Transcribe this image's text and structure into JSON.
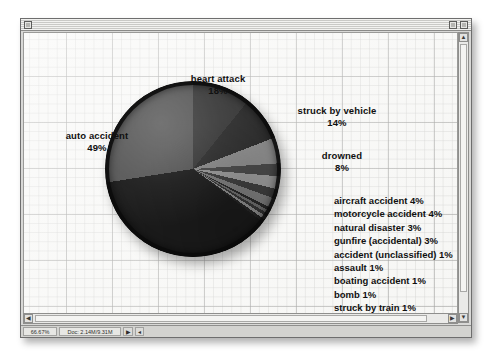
{
  "window": {
    "close_box": "close-box",
    "zoom_box": "zoom-box",
    "collapse_box": "collapse-box"
  },
  "statusbar": {
    "zoom_level": "66.67%",
    "doc_size": "Doc: 2.14M/9.31M",
    "popup_arrow": "▶",
    "caret": "◂"
  },
  "scrollbar": {
    "up_arrow": "▲",
    "down_arrow": "▼",
    "left_arrow": "◀",
    "right_arrow": "▶"
  },
  "labels": {
    "heart_attack": {
      "name": "heart attack",
      "pct": "18%"
    },
    "struck_by_vehicle": {
      "name": "struck by vehicle",
      "pct": "14%"
    },
    "drowned": {
      "name": "drowned",
      "pct": "8%"
    },
    "auto_accident": {
      "name": "auto accident",
      "pct": "49%"
    },
    "gunfire": {
      "name": "gunfire",
      "pct": "62%"
    }
  },
  "small_labels": [
    "aircraft accident 4%",
    "motorcycle accident 4%",
    "natural disaster 3%",
    "gunfire (accidental) 3%",
    "accident (unclassified) 1%",
    "assault 1%",
    "boating accident 1%",
    "bomb 1%",
    "struck by train 1%"
  ],
  "chart_data": {
    "type": "pie",
    "title": "",
    "legend_position": "callout-labels",
    "categories": [
      "gunfire",
      "auto accident",
      "heart attack",
      "struck by vehicle",
      "drowned",
      "aircraft accident",
      "motorcycle accident",
      "natural disaster",
      "gunfire (accidental)",
      "accident (unclassified)",
      "assault",
      "boating accident",
      "bomb",
      "struck by train"
    ],
    "values": [
      62,
      49,
      18,
      14,
      8,
      4,
      4,
      3,
      3,
      1,
      1,
      1,
      1,
      1
    ],
    "value_labels": [
      "62%",
      "49%",
      "18%",
      "14%",
      "8%",
      "4%",
      "4%",
      "3%",
      "3%",
      "1%",
      "1%",
      "1%",
      "1%",
      "1%"
    ],
    "colors": [
      "#1c1c1c",
      "#585858",
      "#3a3a3a",
      "#2e2e2e",
      "#8c8c8c",
      "#4a4a4a",
      "#9a9a9a",
      "#3f3f3f",
      "#7e7e7e",
      "#2b2b2b",
      "#6f6f6f",
      "#383838",
      "#8f8f8f",
      "#262626"
    ],
    "slice_gradient": "conic-gradient(from 0deg at 50% 50%, #3a3a3a 0deg 38.9deg, #2e2e2e 38.9deg 68.9deg, #8c8c8c 68.9deg 86.2deg, #4a4a4a 86.2deg 94.9deg, #9a9a9a 94.9deg 103.5deg, #3f3f3f 103.5deg 110deg, #7e7e7e 110deg 116.5deg, #2b2b2b 116.5deg 118.7deg, #6f6f6f 118.7deg 120.8deg, #383838 120.8deg 123deg, #8f8f8f 123deg 125.2deg, #262626 125.2deg 127.3deg, #1c1c1c 127.3deg 261.1deg, #585858 261.1deg 360deg)"
  }
}
